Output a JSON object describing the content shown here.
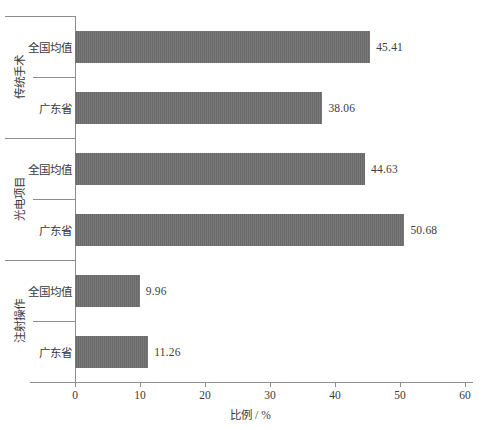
{
  "chart_data": {
    "type": "bar",
    "orientation": "horizontal",
    "title": "",
    "xlabel": "比例 / %",
    "ylabel": "",
    "xlim": [
      0,
      60
    ],
    "xticks": [
      0,
      10,
      20,
      30,
      40,
      50,
      60
    ],
    "grid": false,
    "legend": null,
    "bar_color": "#6f6f6f",
    "axis_color": "#8d8d8d",
    "groups": [
      {
        "label": "传统手术",
        "items": [
          {
            "label": "全国均值",
            "value": 45.41,
            "value_text": "45.41"
          },
          {
            "label": "广东省",
            "value": 38.06,
            "value_text": "38.06"
          }
        ]
      },
      {
        "label": "光电项目",
        "items": [
          {
            "label": "全国均值",
            "value": 44.63,
            "value_text": "44.63"
          },
          {
            "label": "广东省",
            "value": 50.68,
            "value_text": "50.68"
          }
        ]
      },
      {
        "label": "注射操作",
        "items": [
          {
            "label": "全国均值",
            "value": 9.96,
            "value_text": "9.96"
          },
          {
            "label": "广东省",
            "value": 11.26,
            "value_text": "11.26"
          }
        ]
      }
    ],
    "categories": [
      "传统手术 - 全国均值",
      "传统手术 - 广东省",
      "光电项目 - 全国均值",
      "光电项目 - 广东省",
      "注射操作 - 全国均值",
      "注射操作 - 广东省"
    ],
    "values": [
      45.41,
      38.06,
      44.63,
      50.68,
      9.96,
      11.26
    ]
  }
}
